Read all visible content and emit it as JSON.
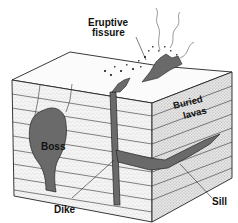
{
  "diagram": {
    "labels": {
      "eruptive_fissure_line1": "Eruptive",
      "eruptive_fissure_line2": "fissure",
      "buried_lavas_line1": "Buried",
      "buried_lavas_line2": "lavas",
      "boss": "Boss",
      "dike": "Dike",
      "sill": "Sill"
    },
    "colors": {
      "magma": "#6a6a6a",
      "strata": "#efefef",
      "outline": "#222222",
      "background": "#ffffff"
    }
  }
}
